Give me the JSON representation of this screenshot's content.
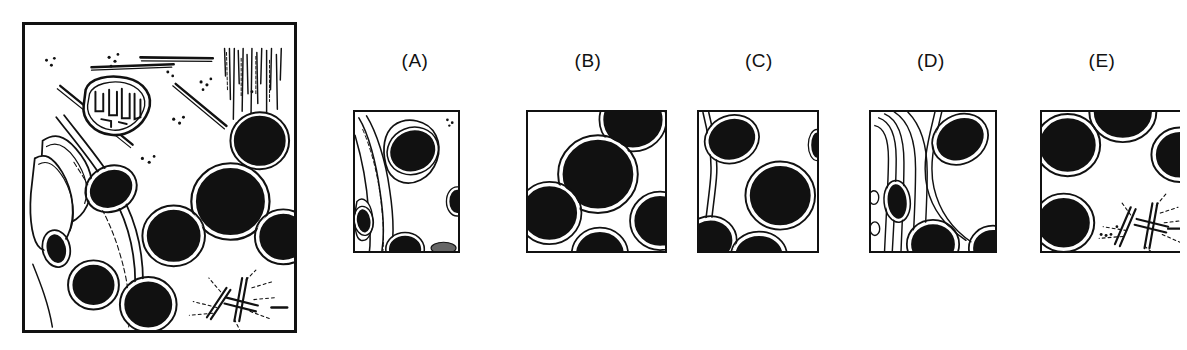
{
  "figure": {
    "type": "multiple-choice-micrograph-figure",
    "background_color": "#ffffff",
    "ink_color": "#111111",
    "main_panel": {
      "name": "reference-cell-micrograph",
      "border_color": "#111111",
      "contents": [
        "mitochondrion-with-cristae",
        "microtubule-bundles",
        "intermediate-filament-bundle",
        "endoplasmic-reticulum-cisternae",
        "dark-round-nuclei-granules",
        "ribosome-dots",
        "aster-starburst-filaments"
      ]
    },
    "options": [
      {
        "id": "A",
        "label": "(A)",
        "name": "option-panel-a",
        "features": [
          "er-cisternae-lines",
          "ovoid-dense-granule",
          "small-dense-granule",
          "edge-granules"
        ]
      },
      {
        "id": "B",
        "label": "(B)",
        "name": "option-panel-b",
        "features": [
          "large-round-dense-granules",
          "halo-rings"
        ]
      },
      {
        "id": "C",
        "label": "(C)",
        "name": "option-panel-c",
        "features": [
          "round-dense-granules",
          "curved-membrane-line",
          "halo-rings"
        ]
      },
      {
        "id": "D",
        "label": "(D)",
        "name": "option-panel-d",
        "features": [
          "er-cisternae-lines",
          "ovoid-dense-granules",
          "small-vesicles"
        ]
      },
      {
        "id": "E",
        "label": "(E)",
        "name": "option-panel-e",
        "features": [
          "round-dense-granules",
          "aster-starburst-filaments",
          "dashed-radiating-fibers"
        ]
      }
    ]
  }
}
